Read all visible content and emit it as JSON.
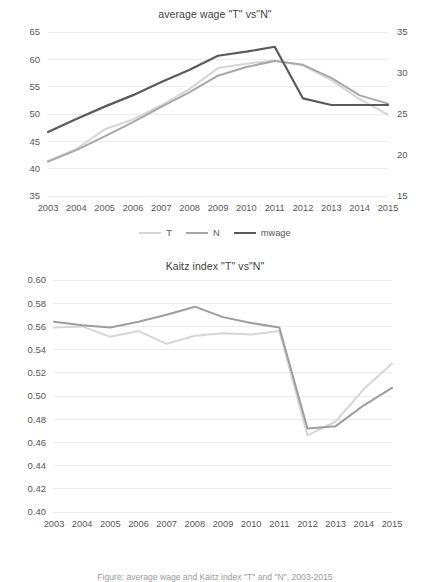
{
  "figure": {
    "caption": "Figure: average wage and Kaitz index \"T\" and \"N\", 2003-2015"
  },
  "chart_data": [
    {
      "id": "average-wage",
      "type": "line",
      "title": "average wage \"T\" vs\"N\"",
      "xlabel": "",
      "ylabel": "",
      "grid": true,
      "legend_position": "bottom",
      "x": [
        "2003",
        "2004",
        "2005",
        "2006",
        "2007",
        "2008",
        "2009",
        "2010",
        "2011",
        "2012",
        "2013",
        "2014",
        "2015"
      ],
      "left_axis": {
        "ylim": [
          35,
          65
        ],
        "ticks": [
          "35",
          "40",
          "45",
          "50",
          "55",
          "60",
          "65"
        ],
        "tick_values": [
          35,
          40,
          45,
          50,
          55,
          60,
          65
        ]
      },
      "right_axis": {
        "ylim": [
          15,
          35
        ],
        "ticks": [
          "15",
          "20",
          "25",
          "30",
          "35"
        ],
        "tick_values": [
          15,
          20,
          25,
          30,
          35
        ]
      },
      "series": [
        {
          "name": "T",
          "axis": "left",
          "color": "#d6d6d6",
          "width": 2.0,
          "values": [
            41.4,
            43.6,
            47.2,
            49.0,
            51.6,
            54.6,
            58.4,
            59.2,
            59.8,
            58.9,
            56.2,
            52.7,
            49.9
          ]
        },
        {
          "name": "N",
          "axis": "left",
          "color": "#a8a8a8",
          "width": 2.0,
          "values": [
            41.3,
            43.4,
            45.9,
            48.5,
            51.3,
            54.0,
            57.0,
            58.6,
            59.7,
            59.0,
            56.6,
            53.4,
            51.9
          ]
        },
        {
          "name": "mwage",
          "axis": "right",
          "color": "#5a5a5a",
          "width": 2.2,
          "values": [
            22.8,
            24.4,
            25.9,
            27.3,
            28.9,
            30.4,
            32.1,
            32.6,
            33.2,
            26.9,
            26.1,
            26.1,
            26.1
          ]
        }
      ]
    },
    {
      "id": "kaitz-index",
      "type": "line",
      "title": "Kaitz index \"T\" vs\"N\"",
      "xlabel": "",
      "ylabel": "",
      "grid": true,
      "legend_position": "bottom",
      "x": [
        "2003",
        "2004",
        "2005",
        "2006",
        "2007",
        "2008",
        "2009",
        "2010",
        "2011",
        "2012",
        "2013",
        "2014",
        "2015"
      ],
      "left_axis": {
        "ylim": [
          0.4,
          0.6
        ],
        "ticks": [
          "0.40",
          "0.42",
          "0.44",
          "0.46",
          "0.48",
          "0.50",
          "0.52",
          "0.54",
          "0.56",
          "0.58",
          "0.60"
        ],
        "tick_values": [
          0.4,
          0.42,
          0.44,
          0.46,
          0.48,
          0.5,
          0.52,
          0.54,
          0.56,
          0.58,
          0.6
        ]
      },
      "series": [
        {
          "name": "T",
          "axis": "left",
          "color": "#d6d6d6",
          "width": 2.0,
          "values": [
            0.559,
            0.56,
            0.551,
            0.556,
            0.545,
            0.552,
            0.554,
            0.553,
            0.556,
            0.466,
            0.478,
            0.506,
            0.528
          ]
        },
        {
          "name": "N",
          "axis": "left",
          "color": "#9d9d9d",
          "width": 2.0,
          "values": [
            0.564,
            0.561,
            0.559,
            0.564,
            0.57,
            0.577,
            0.568,
            0.563,
            0.559,
            0.472,
            0.474,
            0.492,
            0.507
          ]
        }
      ]
    }
  ],
  "charts": {
    "chart1": {
      "title": "average wage \"T\" vs\"N\"",
      "legend": [
        {
          "label": "T",
          "color": "#d6d6d6"
        },
        {
          "label": "N",
          "color": "#a8a8a8"
        },
        {
          "label": "mwage",
          "color": "#5a5a5a"
        }
      ]
    },
    "chart2": {
      "title": "Kaitz index \"T\" vs\"N\"",
      "legend": [
        {
          "label": "T",
          "color": "#d6d6d6"
        },
        {
          "label": "N",
          "color": "#9d9d9d"
        }
      ]
    }
  }
}
